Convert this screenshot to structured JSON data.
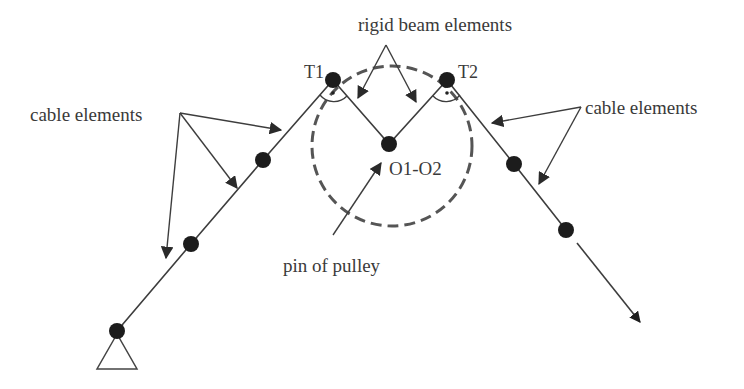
{
  "diagram": {
    "type": "pulley cable finite element model",
    "colors": {
      "background": "#ffffff",
      "lines": "#3d3d3d",
      "nodes": "#1c1c1c",
      "pulley_outline": "#555555",
      "text": "#3a3a3a"
    },
    "labels": {
      "rigid_beam": "rigid beam elements",
      "cable_left": "cable elements",
      "cable_right": "cable elements",
      "t1": "T1",
      "t2": "T2",
      "center": "O1-O2",
      "pin": "pin of pulley"
    },
    "nodes": [
      {
        "id": "support",
        "x": 117,
        "y": 331
      },
      {
        "id": "left-2",
        "x": 191,
        "y": 244
      },
      {
        "id": "left-3",
        "x": 263,
        "y": 160
      },
      {
        "id": "T1",
        "x": 333,
        "y": 80
      },
      {
        "id": "O1-O2",
        "x": 389,
        "y": 144
      },
      {
        "id": "T2",
        "x": 447,
        "y": 80
      },
      {
        "id": "right-1",
        "x": 514,
        "y": 164
      },
      {
        "id": "right-2",
        "x": 566,
        "y": 230
      }
    ],
    "pulley": {
      "cx": 392,
      "cy": 146,
      "r": 80,
      "style": "dashed"
    },
    "load_arrow": {
      "from": [
        577,
        243
      ],
      "to": [
        640,
        322
      ]
    }
  }
}
